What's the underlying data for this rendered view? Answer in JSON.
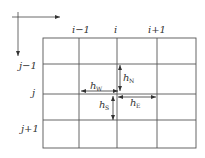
{
  "diagram": {
    "type": "finite-difference grid stencil",
    "column_labels": [
      "i−1",
      "i",
      "i+1"
    ],
    "row_labels": [
      "j−1",
      "j",
      "j+1"
    ],
    "spacing_labels": {
      "west": {
        "base": "h",
        "sub": "W"
      },
      "north": {
        "base": "h",
        "sub": "N"
      },
      "east": {
        "base": "h",
        "sub": "E"
      },
      "south": {
        "base": "h",
        "sub": "S"
      }
    },
    "axes": [
      "x-axis-arrow",
      "y-axis-arrow"
    ],
    "colors": {
      "line": "#555555",
      "text": "#333333",
      "background": "#ffffff"
    }
  }
}
